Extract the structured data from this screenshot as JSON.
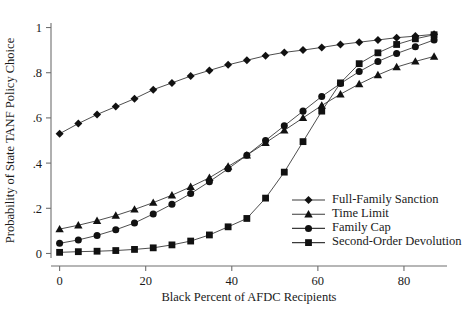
{
  "chart_data": {
    "type": "line",
    "title": "",
    "xlabel": "Black Percent of AFDC Recipients",
    "ylabel": "Probability of State TANF Policy Choice",
    "xlim": [
      -2,
      90
    ],
    "ylim": [
      -0.02,
      1.02
    ],
    "xticks": [
      0,
      20,
      40,
      60,
      80
    ],
    "xticklabels": [
      "0",
      "20",
      "40",
      "60",
      "80"
    ],
    "yticks": [
      0,
      0.2,
      0.4,
      0.6,
      0.8,
      1
    ],
    "yticklabels": [
      "0",
      ".2",
      ".4",
      ".6",
      ".8",
      "1"
    ],
    "grid": false,
    "legend_position": "lower-right",
    "x": [
      0,
      4.35,
      8.7,
      13.05,
      17.4,
      21.75,
      26.1,
      30.45,
      34.8,
      39.15,
      43.5,
      47.85,
      52.2,
      56.55,
      60.9,
      65.25,
      69.6,
      73.95,
      78.3,
      82.65,
      87
    ],
    "series": [
      {
        "name": "Full-Family Sanction",
        "marker": "diamond",
        "values": [
          0.53,
          0.575,
          0.615,
          0.65,
          0.685,
          0.725,
          0.755,
          0.785,
          0.81,
          0.835,
          0.855,
          0.875,
          0.89,
          0.9,
          0.912,
          0.925,
          0.935,
          0.945,
          0.955,
          0.962,
          0.97
        ]
      },
      {
        "name": "Time Limit",
        "marker": "triangle",
        "values": [
          0.108,
          0.125,
          0.145,
          0.168,
          0.195,
          0.225,
          0.258,
          0.295,
          0.335,
          0.385,
          0.435,
          0.49,
          0.545,
          0.6,
          0.655,
          0.705,
          0.75,
          0.79,
          0.825,
          0.85,
          0.872
        ]
      },
      {
        "name": "Family Cap",
        "marker": "circle",
        "values": [
          0.045,
          0.06,
          0.08,
          0.105,
          0.135,
          0.175,
          0.218,
          0.265,
          0.318,
          0.375,
          0.435,
          0.5,
          0.565,
          0.63,
          0.695,
          0.752,
          0.805,
          0.85,
          0.885,
          0.915,
          0.945
        ]
      },
      {
        "name": "Second-Order Devolution",
        "marker": "square",
        "values": [
          0.005,
          0.008,
          0.01,
          0.013,
          0.018,
          0.025,
          0.038,
          0.055,
          0.082,
          0.118,
          0.155,
          0.245,
          0.36,
          0.495,
          0.63,
          0.755,
          0.84,
          0.888,
          0.925,
          0.95,
          0.968
        ]
      }
    ]
  }
}
